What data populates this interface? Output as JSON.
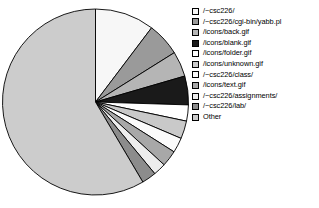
{
  "chart_data": {
    "type": "pie",
    "title": "",
    "xlabel": "",
    "ylabel": "",
    "legend_position": "right",
    "start_angle_deg": 0,
    "direction": "clockwise",
    "categories": [
      "/~csc226/",
      "/~csc226/cgi-bin/yabb.pl",
      "/icons/back.gif",
      "/icons/blank.gif",
      "/icons/folder.gif",
      "/icons/unknown.gif",
      "/~csc226/class/",
      "/icons/text.gif",
      "/~csc226/assignments/",
      "/~csc226/lab/",
      "Other"
    ],
    "values": [
      10.3,
      5.8,
      4.4,
      5.0,
      2.8,
      3.1,
      2.6,
      2.8,
      2.2,
      2.5,
      58.5
    ],
    "colors": [
      "#f7f7f7",
      "#9a9a9a",
      "#b5b5b5",
      "#1a1a1a",
      "#ffffff",
      "#c9c9c9",
      "#fbfbfb",
      "#a8a8a8",
      "#ededed",
      "#8c8c8c",
      "#cccccc"
    ],
    "slice_edge_color": "#000000",
    "background": "#ffffff"
  },
  "legend": {
    "items": [
      {
        "label": "/~csc226/",
        "color": "#f7f7f7"
      },
      {
        "label": "/~csc226/cgi-bin/yabb.pl",
        "color": "#9a9a9a"
      },
      {
        "label": "/icons/back.gif",
        "color": "#b5b5b5"
      },
      {
        "label": "/icons/blank.gif",
        "color": "#1a1a1a"
      },
      {
        "label": "/icons/folder.gif",
        "color": "#ffffff"
      },
      {
        "label": "/icons/unknown.gif",
        "color": "#c9c9c9"
      },
      {
        "label": "/~csc226/class/",
        "color": "#fbfbfb"
      },
      {
        "label": "/icons/text.gif",
        "color": "#a8a8a8"
      },
      {
        "label": "/~csc226/assignments/",
        "color": "#ededed"
      },
      {
        "label": "/~csc226/lab/",
        "color": "#8c8c8c"
      },
      {
        "label": "Other",
        "color": "#cccccc"
      }
    ]
  }
}
